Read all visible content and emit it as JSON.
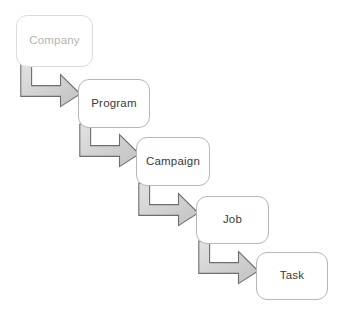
{
  "diagram": {
    "type": "flowchart-cascade",
    "background_color": "#ffffff",
    "node_fill_color": "#ffffff",
    "node_border_color": "#b7b7b7",
    "arrow_fill_color": "#d2d2d2",
    "arrow_border_color": "#6e6e6e",
    "text_color": "#3a3a3a",
    "faded_text_color": "#b4b4b4",
    "nodes": [
      {
        "id": "company",
        "label": "Company",
        "x": 16,
        "y": 15,
        "w": 77,
        "h": 52,
        "faded": true
      },
      {
        "id": "program",
        "label": "Program",
        "x": 78,
        "y": 79,
        "w": 72,
        "h": 49,
        "faded": false
      },
      {
        "id": "campaign",
        "label": "Campaign",
        "x": 136,
        "y": 137,
        "w": 74,
        "h": 49,
        "faded": false
      },
      {
        "id": "job",
        "label": "Job",
        "x": 196,
        "y": 196,
        "w": 73,
        "h": 48,
        "faded": false
      },
      {
        "id": "task",
        "label": "Task",
        "x": 256,
        "y": 252,
        "w": 72,
        "h": 48,
        "faded": false
      }
    ],
    "connectors": [
      {
        "id": "company-to-program",
        "from": "Company",
        "to": "Program",
        "shape": "elbow-down-right",
        "x": 20,
        "y": 64,
        "w": 61,
        "h": 43
      },
      {
        "id": "program-to-campaign",
        "from": "Program",
        "to": "Campaign",
        "shape": "elbow-down-right",
        "x": 79,
        "y": 124,
        "w": 61,
        "h": 43
      },
      {
        "id": "campaign-to-job",
        "from": "Campaign",
        "to": "Job",
        "shape": "elbow-down-right",
        "x": 138,
        "y": 183,
        "w": 61,
        "h": 43
      },
      {
        "id": "job-to-task",
        "from": "Job",
        "to": "Task",
        "shape": "elbow-down-right",
        "x": 198,
        "y": 241,
        "w": 61,
        "h": 43
      }
    ]
  }
}
